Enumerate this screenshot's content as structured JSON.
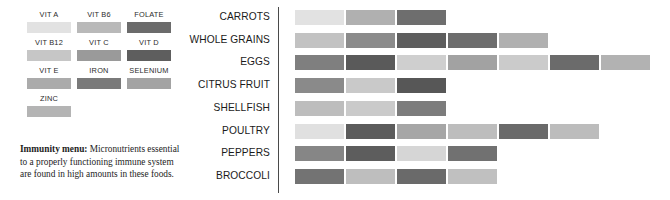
{
  "legend": {
    "title": "Immunity menu legend",
    "nutrients": [
      {
        "label": "VIT A",
        "color": "#e2e2e2"
      },
      {
        "label": "VIT B6",
        "color": "#b9b9b9"
      },
      {
        "label": "FOLATE",
        "color": "#6b6b6b"
      },
      {
        "label": "VIT B12",
        "color": "#c6c6c6"
      },
      {
        "label": "VIT C",
        "color": "#9a9a9a"
      },
      {
        "label": "VIT D",
        "color": "#5e5e5e"
      },
      {
        "label": "VIT E",
        "color": "#ababab"
      },
      {
        "label": "IRON",
        "color": "#7a7a7a"
      },
      {
        "label": "SELENIUM",
        "color": "#a3a3a3"
      },
      {
        "label": "ZINC",
        "color": "#b4b4b4"
      }
    ],
    "caption_strong": "Immunity menu:",
    "caption_text": " Micronutrients essential to a properly functioning immune system are found in high amounts in these foods."
  },
  "chart_data": {
    "type": "bar",
    "orientation": "horizontal",
    "stacked": true,
    "title": "",
    "xlabel": "",
    "ylabel": "",
    "grid": false,
    "legend_position": "left-panel",
    "unit": "micronutrient segments",
    "categories": [
      "CARROTS",
      "WHOLE GRAINS",
      "EGGS",
      "CITRUS FRUIT",
      "SHELLFISH",
      "POULTRY",
      "PEPPERS",
      "BROCCOLI"
    ],
    "values": [
      3,
      5,
      7,
      3,
      3,
      6,
      4,
      4
    ],
    "rows": [
      {
        "label": "CARROTS",
        "count": 3,
        "segments": [
          "#e2e2e2",
          "#b0b0b0",
          "#6e6e6e"
        ]
      },
      {
        "label": "WHOLE GRAINS",
        "count": 5,
        "segments": [
          "#c2c2c2",
          "#8b8b8b",
          "#5e5e5e",
          "#6d6d6d",
          "#b0b0b0"
        ]
      },
      {
        "label": "EGGS",
        "count": 7,
        "segments": [
          "#7f7f7f",
          "#5a5a5a",
          "#cfcfcf",
          "#a2a2a2",
          "#cbcbcb",
          "#6b6b6b",
          "#b2b2b2"
        ]
      },
      {
        "label": "CITRUS FRUIT",
        "count": 3,
        "segments": [
          "#8a8a8a",
          "#c9c9c9",
          "#575757"
        ]
      },
      {
        "label": "SHELLFISH",
        "count": 3,
        "segments": [
          "#bdbdbd",
          "#cacaca",
          "#7c7c7c"
        ]
      },
      {
        "label": "POULTRY",
        "count": 6,
        "segments": [
          "#e0e0e0",
          "#5c5c5c",
          "#a6a6a6",
          "#bdbdbd",
          "#6a6a6a",
          "#bcbcbc"
        ]
      },
      {
        "label": "PEPPERS",
        "count": 4,
        "segments": [
          "#868686",
          "#5d5d5d",
          "#d6d6d6",
          "#717171"
        ]
      },
      {
        "label": "BROCCOLI",
        "count": 4,
        "segments": [
          "#737373",
          "#bebebe",
          "#6a6a6a",
          "#c0c0c0"
        ]
      }
    ]
  }
}
